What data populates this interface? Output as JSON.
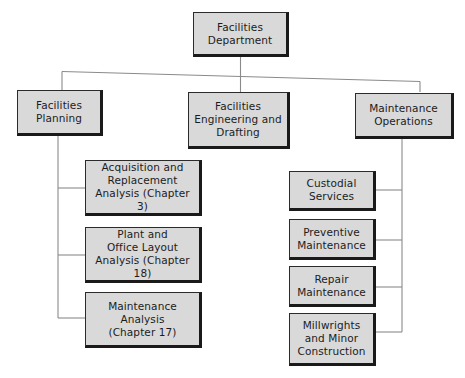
{
  "diagram": {
    "type": "organization-chart",
    "colors": {
      "box_fill": "#d9d9d9",
      "box_border": "#2b2b2b",
      "line": "#8a8a8a",
      "text": "#1c1c1c",
      "background": "#ffffff"
    },
    "root": {
      "label": "Facilities\nDepartment"
    },
    "divisions": [
      {
        "label": "Facilities\nPlanning",
        "children": [
          {
            "label": "Acquisition and\nReplacement\nAnalysis (Chapter 3)"
          },
          {
            "label": "Plant and\nOffice Layout\nAnalysis (Chapter 18)"
          },
          {
            "label": "Maintenance\nAnalysis\n(Chapter 17)"
          }
        ]
      },
      {
        "label": "Facilities\nEngineering and\nDrafting",
        "children": []
      },
      {
        "label": "Maintenance\nOperations",
        "children": [
          {
            "label": "Custodial\nServices"
          },
          {
            "label": "Preventive\nMaintenance"
          },
          {
            "label": "Repair\nMaintenance"
          },
          {
            "label": "Millwrights\nand Minor\nConstruction"
          }
        ]
      }
    ]
  }
}
